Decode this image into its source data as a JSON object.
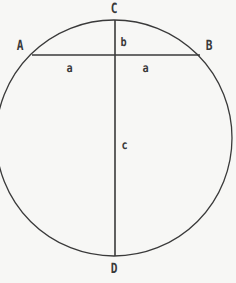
{
  "figure": {
    "kind": "geometry-diagram",
    "background_color": "#f7f7f5",
    "stroke_color": "#3a3a3a",
    "label_color": "#3a3a3a",
    "canvas": {
      "width": 236,
      "height": 283
    },
    "circle": {
      "center_x": 114,
      "center_y": 138,
      "radius": 118,
      "stroke_width": 1.3
    },
    "diameter": {
      "name": "CD",
      "x": 115,
      "y_top": 20,
      "y_bottom": 256,
      "stroke_width": 1.6
    },
    "chord": {
      "name": "AB",
      "y": 55,
      "x_left": 32,
      "x_right": 200,
      "stroke_width": 1.6
    },
    "intersection": {
      "x": 115,
      "y": 55
    }
  },
  "labels": {
    "point_c": {
      "text": "C",
      "x": 110,
      "y": 2
    },
    "point_a": {
      "text": "A",
      "x": 16,
      "y": 39
    },
    "point_b": {
      "text": "B",
      "x": 205,
      "y": 39
    },
    "point_d": {
      "text": "D",
      "x": 110,
      "y": 262
    },
    "segment_b": {
      "text": "b",
      "x": 120,
      "y": 36
    },
    "segment_a_left": {
      "text": "a",
      "x": 66,
      "y": 62
    },
    "segment_a_right": {
      "text": "a",
      "x": 142,
      "y": 62
    },
    "segment_c": {
      "text": "c",
      "x": 121,
      "y": 139
    }
  },
  "caption": {
    "faint_bottom_text": "",
    "visible": false
  }
}
